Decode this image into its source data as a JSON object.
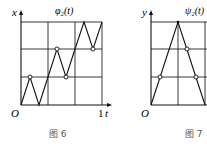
{
  "figures": [
    {
      "id": "fig6",
      "caption": "图 6",
      "function_label": "φ₂(t)",
      "y_axis_label": "x",
      "x_axis_label": "t",
      "origin_label": "O",
      "x_end_label": "1",
      "grid": {
        "cols": 3,
        "rows": 3
      },
      "curve_points": [
        [
          0,
          0
        ],
        [
          0.333,
          1
        ],
        [
          0.667,
          0
        ],
        [
          1.0,
          1
        ],
        [
          1.333,
          2
        ],
        [
          1.667,
          1
        ],
        [
          2.0,
          2
        ],
        [
          2.333,
          3
        ],
        [
          2.667,
          2
        ],
        [
          3.0,
          3
        ]
      ],
      "marked_points": [
        [
          0.333,
          1
        ],
        [
          1.333,
          2
        ],
        [
          1.667,
          1
        ],
        [
          2.667,
          2
        ]
      ]
    },
    {
      "id": "fig7",
      "caption": "图 7",
      "function_label": "ψ₂(t)",
      "y_axis_label": "y",
      "origin_label": "O",
      "grid": {
        "cols": 2,
        "rows": 3
      },
      "curve_points": [
        [
          0,
          0
        ],
        [
          1,
          3
        ],
        [
          2,
          0
        ]
      ],
      "marked_points": [
        [
          0.333,
          1
        ],
        [
          1.333,
          2
        ],
        [
          1.667,
          1
        ]
      ]
    }
  ]
}
